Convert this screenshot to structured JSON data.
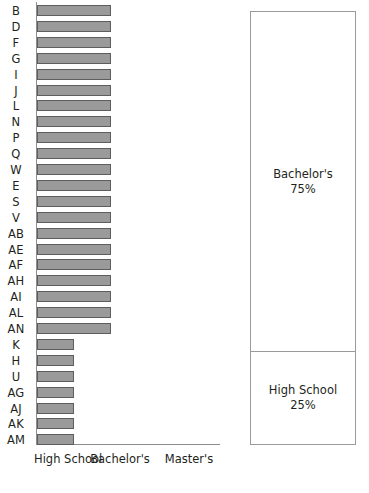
{
  "chart_data": {
    "type": "bar",
    "orientation": "horizontal",
    "title": "",
    "xlabel": "",
    "ylabel": "",
    "grid": false,
    "legend": false,
    "x_tick_labels": [
      "High School",
      "Bachelor's",
      "Master's"
    ],
    "x_categories_ordinal": [
      1,
      2,
      3
    ],
    "xlim": [
      0,
      3.5
    ],
    "categories": [
      "B",
      "D",
      "F",
      "G",
      "I",
      "J",
      "L",
      "N",
      "P",
      "Q",
      "W",
      "E",
      "S",
      "V",
      "AB",
      "AE",
      "AF",
      "AH",
      "AI",
      "AL",
      "AN",
      "K",
      "H",
      "U",
      "AG",
      "AJ",
      "AK",
      "AM"
    ],
    "values": [
      2,
      2,
      2,
      2,
      2,
      2,
      2,
      2,
      2,
      2,
      2,
      2,
      2,
      2,
      2,
      2,
      2,
      2,
      2,
      2,
      2,
      1,
      1,
      1,
      1,
      1,
      1,
      1
    ],
    "value_meaning": "1 = High School, 2 = Bachelor's",
    "bar_color": "#9a9a9a",
    "bar_edge_color": "#5d5d5d",
    "axis_color": "#8d8d8d",
    "bars": [
      {
        "label": "B",
        "value": 2
      },
      {
        "label": "D",
        "value": 2
      },
      {
        "label": "F",
        "value": 2
      },
      {
        "label": "G",
        "value": 2
      },
      {
        "label": "I",
        "value": 2
      },
      {
        "label": "J",
        "value": 2
      },
      {
        "label": "L",
        "value": 2
      },
      {
        "label": "N",
        "value": 2
      },
      {
        "label": "P",
        "value": 2
      },
      {
        "label": "Q",
        "value": 2
      },
      {
        "label": "W",
        "value": 2
      },
      {
        "label": "E",
        "value": 2
      },
      {
        "label": "S",
        "value": 2
      },
      {
        "label": "V",
        "value": 2
      },
      {
        "label": "AB",
        "value": 2
      },
      {
        "label": "AE",
        "value": 2
      },
      {
        "label": "AF",
        "value": 2
      },
      {
        "label": "AH",
        "value": 2
      },
      {
        "label": "AI",
        "value": 2
      },
      {
        "label": "AL",
        "value": 2
      },
      {
        "label": "AN",
        "value": 2
      },
      {
        "label": "K",
        "value": 1
      },
      {
        "label": "H",
        "value": 1
      },
      {
        "label": "U",
        "value": 1
      },
      {
        "label": "AG",
        "value": 1
      },
      {
        "label": "AJ",
        "value": 1
      },
      {
        "label": "AK",
        "value": 1
      },
      {
        "label": "AM",
        "value": 1
      }
    ],
    "summary_panel": {
      "type": "stacked-proportion",
      "border_color": "#9b9b9b",
      "segments": [
        {
          "name": "Bachelor's",
          "percent": 75,
          "percent_label": "75%"
        },
        {
          "name": "High School",
          "percent": 25,
          "percent_label": "25%"
        }
      ]
    }
  }
}
